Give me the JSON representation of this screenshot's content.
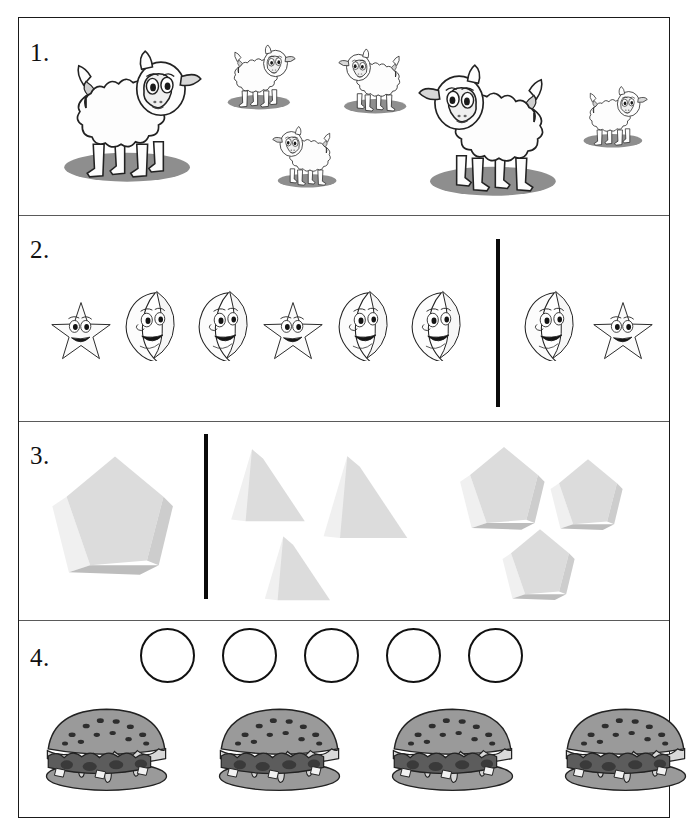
{
  "worksheet": {
    "title": "Counting and comparing worksheet",
    "frame_color": "#1a1a1a",
    "background": "#ffffff"
  },
  "rows": [
    {
      "number": "1.",
      "name": "sheep-row",
      "divider_bar": false,
      "items": [
        {
          "type": "sheep",
          "size": "large",
          "x": 57,
          "y": 33,
          "w": 145,
          "h": 150,
          "flip": false
        },
        {
          "type": "sheep",
          "size": "small",
          "x": 224,
          "y": 36,
          "w": 72,
          "h": 74,
          "flip": false
        },
        {
          "type": "sheep",
          "size": "small",
          "x": 338,
          "y": 40,
          "w": 72,
          "h": 74,
          "flip": true
        },
        {
          "type": "sheep",
          "size": "small",
          "x": 272,
          "y": 118,
          "w": 68,
          "h": 70,
          "flip": true
        },
        {
          "type": "sheep",
          "size": "large",
          "x": 418,
          "y": 47,
          "w": 145,
          "h": 150,
          "flip": true
        },
        {
          "type": "sheep",
          "size": "small",
          "x": 580,
          "y": 78,
          "w": 68,
          "h": 70,
          "flip": false
        }
      ],
      "counts": {
        "large_sheep": 2,
        "small_sheep": 4,
        "total": 6
      }
    },
    {
      "number": "2.",
      "name": "star-moon-row",
      "divider_bar": true,
      "divider_x": 497,
      "divider_top": 238,
      "divider_height": 168,
      "left_group": [
        "star",
        "moon",
        "moon",
        "star",
        "moon",
        "moon"
      ],
      "right_group": [
        "moon",
        "star"
      ],
      "items": [
        {
          "type": "star",
          "x": 50,
          "y": 300,
          "w": 62,
          "h": 60
        },
        {
          "type": "moon",
          "x": 117,
          "y": 289,
          "w": 62,
          "h": 72
        },
        {
          "type": "moon",
          "x": 190,
          "y": 289,
          "w": 62,
          "h": 72
        },
        {
          "type": "star",
          "x": 262,
          "y": 300,
          "w": 62,
          "h": 60
        },
        {
          "type": "moon",
          "x": 330,
          "y": 289,
          "w": 62,
          "h": 72
        },
        {
          "type": "moon",
          "x": 403,
          "y": 289,
          "w": 62,
          "h": 72
        },
        {
          "type": "moon",
          "x": 516,
          "y": 289,
          "w": 62,
          "h": 72
        },
        {
          "type": "star",
          "x": 592,
          "y": 300,
          "w": 62,
          "h": 60
        }
      ],
      "counts": {
        "left": 6,
        "right": 2
      }
    },
    {
      "number": "3.",
      "name": "solids-row",
      "divider_bar": true,
      "divider_x": 205,
      "divider_top": 433,
      "divider_height": 165,
      "items": [
        {
          "type": "pentagon-prism",
          "x": 50,
          "y": 448,
          "w": 130,
          "h": 140
        },
        {
          "type": "triangular-prism",
          "x": 228,
          "y": 442,
          "w": 88,
          "h": 88
        },
        {
          "type": "triangular-prism",
          "x": 320,
          "y": 448,
          "w": 100,
          "h": 100
        },
        {
          "type": "triangular-prism",
          "x": 262,
          "y": 530,
          "w": 78,
          "h": 78
        },
        {
          "type": "pentagon-prism",
          "x": 458,
          "y": 442,
          "w": 92,
          "h": 96
        },
        {
          "type": "pentagon-prism",
          "x": 548,
          "y": 455,
          "w": 80,
          "h": 82
        },
        {
          "type": "pentagon-prism",
          "x": 500,
          "y": 525,
          "w": 80,
          "h": 82
        }
      ],
      "counts": {
        "left_solids": 1,
        "triangular_prisms": 3,
        "pentagonal_prisms": 3
      }
    },
    {
      "number": "4.",
      "name": "burgers-row",
      "divider_bar": false,
      "circles": {
        "count": 5,
        "diameter": 55,
        "start_x": 140,
        "y": 628,
        "gap": 27
      },
      "burgers": {
        "count": 4,
        "width": 133,
        "height": 90,
        "start_x": 40,
        "y": 703,
        "gap": 40
      },
      "counts": {
        "circles": 5,
        "burgers": 4
      }
    }
  ],
  "palette": {
    "ink": "#101010",
    "frame": "#1a1a1a",
    "divider_line": "#5a5a5a",
    "bar": "#0a0a0a",
    "sheep_shadow": "#8e8e8e",
    "sheep_body": "#fdfdfd",
    "solid_light": "#f0f0f0",
    "solid_mid": "#dcdcdc",
    "solid_dark": "#c6c6c6",
    "burger_bun": "#9a9a9a",
    "burger_patty": "#5c5c5c",
    "burger_cheese": "#d8d8d8"
  }
}
